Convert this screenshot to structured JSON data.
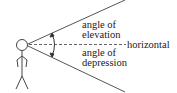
{
  "diagram": {
    "labels": {
      "elevation_line1": "angle of",
      "elevation_line2": "elevation",
      "horizontal": "horizontal",
      "depression_line1": "angle of",
      "depression_line2": "depression"
    },
    "colors": {
      "stroke": "#444444",
      "text": "#222222"
    }
  }
}
